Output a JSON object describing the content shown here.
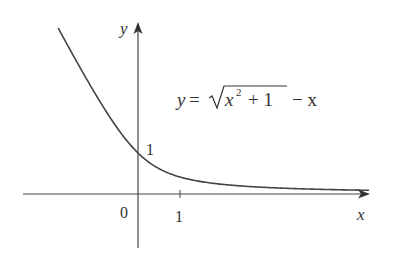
{
  "chart_data": {
    "type": "line",
    "title": "",
    "equation_label": {
      "lhs": "y",
      "eq": "=",
      "radicand": "x",
      "exp": "2",
      "radicand_rest": "+ 1",
      "tail": "− x"
    },
    "xlabel": "x",
    "ylabel": "y",
    "x_ticks": [
      {
        "value": 0,
        "label": "0"
      },
      {
        "value": 1,
        "label": "1"
      }
    ],
    "y_ticks": [
      {
        "value": 1,
        "label": "1"
      }
    ],
    "function": "sqrt(x^2+1) - x",
    "series": [
      {
        "name": "y = sqrt(x^2+1) - x",
        "x": [
          -1.9,
          -1.5,
          -1.0,
          -0.5,
          0,
          0.5,
          1,
          2,
          3,
          4,
          5,
          5.5
        ],
        "y": [
          4.05,
          3.3,
          2.41,
          1.62,
          1.0,
          0.618,
          0.414,
          0.236,
          0.162,
          0.123,
          0.099,
          0.09
        ]
      }
    ],
    "xlim": [
      -2.7,
      5.6
    ],
    "ylim": [
      -1.3,
      4.2
    ],
    "grid": false,
    "legend": "none",
    "color": "#333333"
  }
}
